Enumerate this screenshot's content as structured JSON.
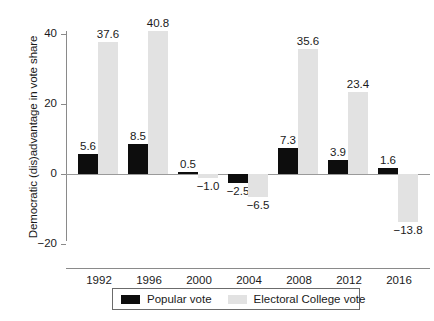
{
  "chart_data": {
    "type": "bar",
    "title": "",
    "subtitle": "",
    "xlabel": "",
    "ylabel": "Democratic (dis)advantage in vote share",
    "categories": [
      "1992",
      "1996",
      "2000",
      "2004",
      "2008",
      "2012",
      "2016"
    ],
    "series": [
      {
        "name": "Popular vote",
        "color": "#0d0d0d",
        "values": [
          5.6,
          8.5,
          0.5,
          -2.5,
          7.3,
          3.9,
          1.6
        ],
        "labels": [
          "5.6",
          "8.5",
          "0.5",
          "−2.5",
          "7.3",
          "3.9",
          "1.6"
        ]
      },
      {
        "name": "Electoral College vote",
        "color": "#e2e2e2",
        "values": [
          37.6,
          40.8,
          -1.0,
          -6.5,
          35.6,
          23.4,
          -13.8
        ],
        "labels": [
          "37.6",
          "40.8",
          "−1.0",
          "−6.5",
          "35.6",
          "23.4",
          "−13.8"
        ]
      }
    ],
    "ylim": [
      -20,
      44
    ],
    "yticks": [
      40,
      20,
      0,
      -20
    ],
    "ytick_labels": [
      "40",
      "20",
      "0",
      "−20"
    ],
    "grid": false,
    "zero_line": true,
    "legend_position": "bottom"
  },
  "legend": {
    "items": [
      {
        "label": "Popular vote",
        "swatch": "popular"
      },
      {
        "label": "Electoral College vote",
        "swatch": "electoral"
      }
    ]
  }
}
